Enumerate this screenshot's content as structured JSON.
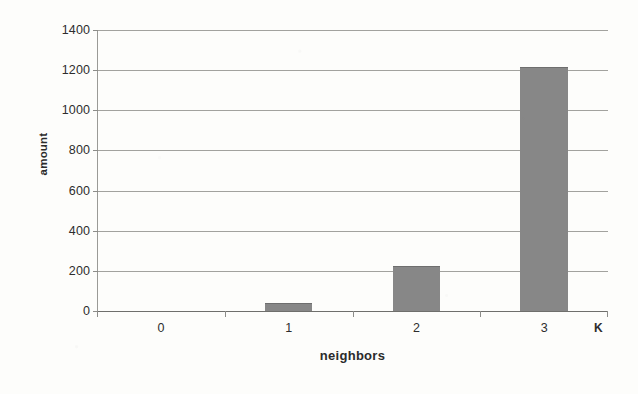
{
  "chart_data": {
    "type": "bar",
    "title": "",
    "subtitle": "",
    "xlabel": "neighbors",
    "ylabel": "amount",
    "categories": [
      "0",
      "1",
      "2",
      "3"
    ],
    "values": [
      0,
      35,
      220,
      1210
    ],
    "series": [
      {
        "name": "amount",
        "values": [
          0,
          35,
          220,
          1210
        ]
      }
    ],
    "ylim": [
      0,
      1400
    ],
    "xlim": [
      0,
      4
    ],
    "y_ticks": [
      0,
      200,
      400,
      600,
      800,
      1000,
      1200,
      1400
    ],
    "y_tick_labels": [
      "0",
      "200",
      "400",
      "600",
      "800",
      "1000",
      "1200",
      "1400"
    ],
    "x_tick_labels": [
      "0",
      "1",
      "2",
      "3"
    ],
    "grid": true,
    "grid_axis": "y",
    "legend": false,
    "legend_position": "none",
    "annotations": [
      {
        "text": "K",
        "position": "x-axis-end",
        "description": "axis-end unit marker at right end of the horizontal axis"
      }
    ],
    "bar_color": "#878787",
    "gridline_color": "#9a9a96",
    "text_color": "#2d2d2d",
    "background_color": "#fdfdfb"
  },
  "axes": {
    "y_title": "amount",
    "x_title": "neighbors",
    "k_marker": "K"
  }
}
